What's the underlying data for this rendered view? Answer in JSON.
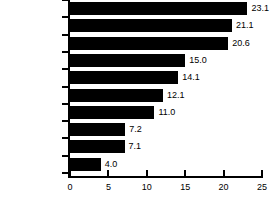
{
  "chart_data": {
    "type": "bar",
    "orientation": "horizontal",
    "title": "",
    "subtitle": "",
    "xlabel": "",
    "ylabel": "",
    "xlim": [
      0,
      25
    ],
    "xticks": [
      0,
      5,
      10,
      15,
      20,
      25
    ],
    "xtick_labels": [
      "0",
      "5",
      "10",
      "15",
      "20",
      "25"
    ],
    "grid": false,
    "legend": null,
    "bar_color": "#000000",
    "background_color": "#ffffff",
    "categories": [
      "Arizona",
      "Nevada",
      "New Mexico",
      "California",
      "Texas",
      "Utah",
      "Colorado",
      "Washington",
      "United States",
      "Oregon"
    ],
    "values": [
      23.1,
      21.1,
      20.6,
      15.0,
      14.1,
      12.1,
      11.0,
      7.2,
      7.1,
      4.0
    ],
    "value_labels": [
      "23.1",
      "21.1",
      "20.6",
      "15.0",
      "14.1",
      "12.1",
      "11.0",
      "7.2",
      "7.1",
      "4.0"
    ]
  }
}
